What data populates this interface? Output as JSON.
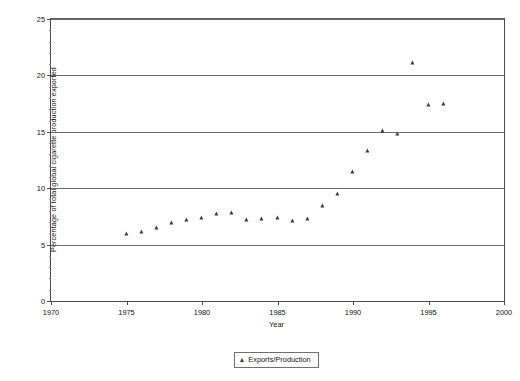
{
  "chart_data": {
    "type": "scatter",
    "title": "",
    "xlabel": "Year",
    "ylabel": "Percentage of total global cigarette production exported",
    "xlim": [
      1970,
      2000
    ],
    "ylim": [
      0,
      25
    ],
    "xticks": [
      1970,
      1975,
      1980,
      1985,
      1990,
      1995,
      2000
    ],
    "yticks": [
      0,
      5,
      10,
      15,
      20,
      25
    ],
    "grid": "horizontal",
    "legend_position": "bottom-center",
    "marker": "triangle",
    "marker_color": "#3b3b3b",
    "series": [
      {
        "name": "Exports/Production",
        "x": [
          1975,
          1976,
          1977,
          1978,
          1979,
          1980,
          1981,
          1982,
          1983,
          1984,
          1985,
          1986,
          1987,
          1988,
          1989,
          1990,
          1991,
          1992,
          1993,
          1994,
          1995,
          1996
        ],
        "values": [
          5.9,
          6.1,
          6.5,
          6.9,
          7.2,
          7.4,
          7.7,
          7.8,
          7.2,
          7.3,
          7.4,
          7.1,
          7.3,
          8.4,
          9.5,
          11.4,
          13.3,
          15.1,
          14.8,
          21.1,
          17.4,
          17.5
        ]
      }
    ]
  },
  "legend": {
    "entries": [
      {
        "label": "Exports/Production"
      }
    ]
  }
}
